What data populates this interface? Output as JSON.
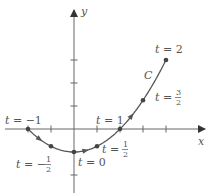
{
  "figure": {
    "axes": {
      "x_label": "x",
      "y_label": "y",
      "origin_px": [
        74,
        129
      ],
      "unit_px": 23,
      "x_ticks": [
        -2,
        -1,
        1,
        2,
        3,
        4
      ],
      "y_ticks": [
        -2,
        -1,
        1,
        2,
        3
      ]
    },
    "curve": {
      "name": "C",
      "parametrization": {
        "x": "2t",
        "y": "t^2 - 1"
      },
      "t_range": [
        -1,
        2
      ],
      "color": "#555555"
    },
    "points": [
      {
        "t": -1,
        "label": "t = −1"
      },
      {
        "t": -0.5,
        "label_prefix": "t = −",
        "num": "1",
        "den": "2"
      },
      {
        "t": 0,
        "label": "t = 0"
      },
      {
        "t": 0.5,
        "label_prefix": "t = ",
        "num": "1",
        "den": "2"
      },
      {
        "t": 1,
        "label": "t = 1"
      },
      {
        "t": 1.5,
        "label_prefix": "t = ",
        "num": "3",
        "den": "2"
      },
      {
        "t": 2,
        "label": "t = 2"
      }
    ]
  },
  "chart_data": {
    "type": "line",
    "title": "",
    "xlabel": "x",
    "ylabel": "y",
    "series": [
      {
        "name": "C",
        "t": [
          -1,
          -0.5,
          0,
          0.5,
          1,
          1.5,
          2
        ],
        "x": [
          -2,
          -1,
          0,
          1,
          2,
          3,
          4
        ],
        "y": [
          0,
          -0.75,
          -1,
          -0.75,
          0,
          1.25,
          3
        ]
      }
    ],
    "annotations": [
      "t = −1",
      "t = −1/2",
      "t = 0",
      "t = 1/2",
      "t = 1",
      "t = 3/2",
      "t = 2",
      "C"
    ],
    "xlim": [
      -3,
      6
    ],
    "ylim": [
      -2.7,
      5
    ],
    "grid": false
  }
}
